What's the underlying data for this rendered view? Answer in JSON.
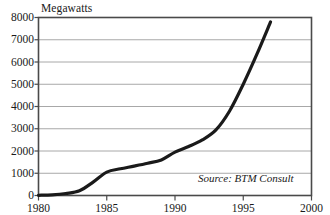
{
  "chart_data": {
    "type": "line",
    "title": "Megawatts",
    "xlabel": "",
    "ylabel": "Megawatts",
    "xlim": [
      1980,
      2000
    ],
    "ylim": [
      0,
      8000
    ],
    "grid": true,
    "legend": false,
    "annotation": "Source: BTM Consult",
    "yticks": [
      8000,
      7000,
      6000,
      5000,
      4000,
      3000,
      2000,
      1000,
      0
    ],
    "xticks": [
      1980,
      1985,
      1990,
      1995,
      2000
    ],
    "series": [
      {
        "name": "Installed wind capacity",
        "color": "#1a1a1a",
        "x": [
          1980,
          1981,
          1982,
          1983,
          1984,
          1985,
          1986,
          1987,
          1988,
          1989,
          1990,
          1991,
          1992,
          1993,
          1994,
          1995,
          1996,
          1997
        ],
        "values": [
          10,
          30,
          90,
          210,
          600,
          1050,
          1200,
          1320,
          1450,
          1600,
          1950,
          2200,
          2500,
          2950,
          3800,
          5000,
          6350,
          7800
        ]
      }
    ]
  },
  "labels": {
    "y": [
      "8000",
      "7000",
      "6000",
      "5000",
      "4000",
      "3000",
      "2000",
      "1000",
      "0"
    ],
    "x": [
      "1980",
      "1985",
      "1990",
      "1995",
      "2000"
    ]
  }
}
